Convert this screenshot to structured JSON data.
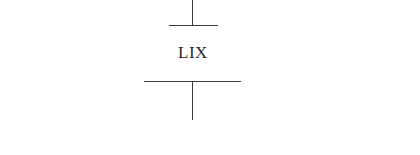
{
  "diagram": {
    "label": "LIX",
    "line_color": "#3a3a3a",
    "text_color": "#2a2a2a",
    "background": "#ffffff"
  }
}
